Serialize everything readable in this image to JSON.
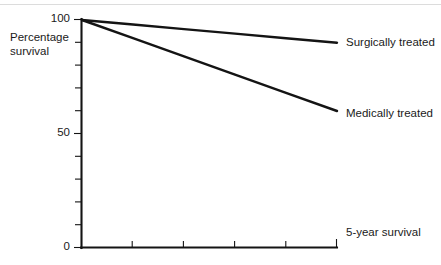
{
  "figure": {
    "name": "survival-curve-figure",
    "background_color": "#ffffff",
    "ink_color": "#141414",
    "rule_color": "#dcdcdc"
  },
  "chart_data": {
    "type": "line",
    "title": "",
    "subtitle": "",
    "xlabel": "",
    "ylabel": "Percentage survival",
    "ylabel_lines": [
      "Percentage",
      "survival"
    ],
    "x": [
      0,
      1,
      2,
      3,
      4,
      5
    ],
    "xlim": [
      0,
      5
    ],
    "ylim": [
      0,
      100
    ],
    "grid": false,
    "legend_position": "right-inline-labels",
    "y_tick_labels": [
      "100",
      "50",
      "0"
    ],
    "y_tick_values": [
      100,
      50,
      0
    ],
    "y_minor_tick_values": [
      90,
      80,
      70,
      60,
      50,
      40,
      30,
      20,
      10
    ],
    "x_tick_values": [
      0,
      1,
      2,
      3,
      4,
      5
    ],
    "x_tick_labels": [
      "",
      "",
      "",
      "",
      "",
      ""
    ],
    "series": [
      {
        "name": "Surgically treated",
        "label": "Surgically treated",
        "values": [
          100,
          98,
          96,
          94,
          92,
          90
        ]
      },
      {
        "name": "Medically treated",
        "label": "Medically treated",
        "values": [
          100,
          92,
          84,
          76,
          68,
          60
        ]
      }
    ],
    "annotations": [
      {
        "name": "five-year-survival-note",
        "text": "5-year survival"
      }
    ]
  },
  "labels": {
    "y_axis_line1": "Percentage",
    "y_axis_line2": "survival",
    "y_top": "100",
    "y_mid": "50",
    "y_bottom": "0",
    "series_surgical": "Surgically treated",
    "series_medical": "Medically treated",
    "five_year": "5-year survival"
  }
}
